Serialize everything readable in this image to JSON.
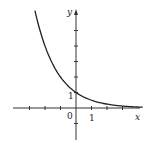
{
  "chart_data": {
    "type": "line",
    "title": "",
    "function": "y = (1/2)^x",
    "xlabel": "x",
    "ylabel": "y",
    "xlim": [
      -4.5,
      4.5
    ],
    "ylim": [
      -2,
      6.5
    ],
    "x_tick_step": 1,
    "y_tick_step": 1,
    "tick_labels": {
      "origin": "0",
      "x_one": "1",
      "y_one": "1"
    },
    "grid": false,
    "legend": null,
    "series": [
      {
        "name": "curve",
        "x": [
          -2.65,
          -2.5,
          -2,
          -1.5,
          -1,
          -0.5,
          0,
          0.5,
          1,
          1.5,
          2,
          2.5,
          3,
          3.5,
          4,
          4.3
        ],
        "y": [
          6.28,
          5.66,
          4.0,
          2.83,
          2.0,
          1.41,
          1.0,
          0.71,
          0.5,
          0.35,
          0.25,
          0.18,
          0.125,
          0.09,
          0.0625,
          0.05
        ]
      }
    ]
  },
  "labels": {
    "x_axis": "x",
    "y_axis": "y",
    "origin": "0",
    "x_one": "1",
    "y_one": "1"
  },
  "colors": {
    "axis": "#333333",
    "curve": "#222222"
  }
}
